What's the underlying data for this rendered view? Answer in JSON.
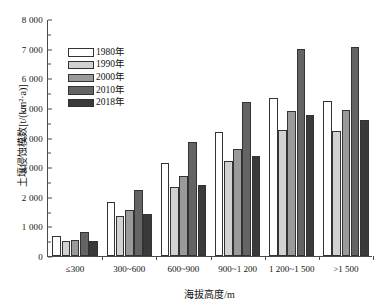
{
  "chart_data": {
    "type": "bar",
    "title": "",
    "xlabel": "海拔高度/m",
    "ylabel": "土壤侵蚀模数[t/(km²·a)]",
    "ylim": [
      0,
      8000
    ],
    "ytick_step": 1000,
    "minor_tick_step": 500,
    "grid": false,
    "legend_position": "upper left",
    "categories": [
      "≤300",
      "300~600",
      "600~900",
      "900~1 200",
      "1 200~1 500",
      ">1 500"
    ],
    "ytick_labels": [
      "0",
      "1 000",
      "2 000",
      "3 000",
      "4 000",
      "5 000",
      "6 000",
      "7 000",
      "8 000"
    ],
    "ytick_values": [
      0,
      1000,
      2000,
      3000,
      4000,
      5000,
      6000,
      7000,
      8000
    ],
    "series": [
      {
        "name": "1980年",
        "color": "#ffffff",
        "values": [
          670,
          1840,
          3130,
          4180,
          5330,
          5220
        ]
      },
      {
        "name": "1990年",
        "color": "#d2d2d2",
        "values": [
          490,
          1340,
          2330,
          3200,
          4270,
          4220
        ]
      },
      {
        "name": "2000年",
        "color": "#9a9a9a",
        "values": [
          540,
          1570,
          2700,
          3620,
          4900,
          4940
        ]
      },
      {
        "name": "2010年",
        "color": "#646464",
        "values": [
          800,
          2230,
          3850,
          5200,
          7000,
          7040
        ]
      },
      {
        "name": "2018年",
        "color": "#3a3a3a",
        "values": [
          510,
          1420,
          2400,
          3390,
          4760,
          4580
        ]
      }
    ]
  }
}
